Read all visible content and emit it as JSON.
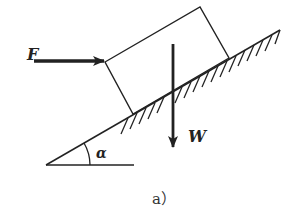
{
  "figure": {
    "caption": "a）",
    "labels": {
      "force_applied": "F",
      "weight": "W",
      "angle": "α"
    },
    "colors": {
      "stroke": "#222222",
      "background": "#ffffff"
    },
    "geometry": {
      "incline_start": [
        46,
        165
      ],
      "incline_end": [
        280,
        30
      ],
      "base_end": [
        134,
        165
      ],
      "block_corners": [
        [
          105,
          62
        ],
        [
          200,
          7
        ],
        [
          229,
          58
        ],
        [
          133,
          114
        ]
      ],
      "force_F_from": [
        34,
        61
      ],
      "force_F_to": [
        105,
        61
      ],
      "weight_W_from": [
        173,
        44
      ],
      "weight_W_to": [
        173,
        148
      ]
    }
  }
}
